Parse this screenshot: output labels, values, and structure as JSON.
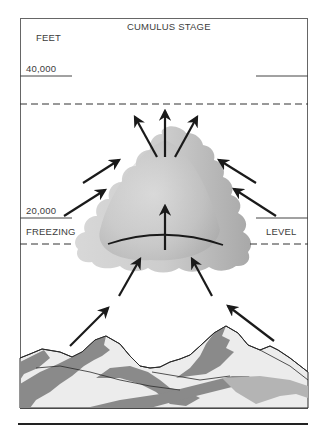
{
  "diagram": {
    "title": "CUMULUS STAGE",
    "axis_unit": "FEET",
    "altitude_marks": [
      {
        "label": "40,000",
        "value_ft": 40000
      },
      {
        "label": "20,000",
        "value_ft": 20000
      }
    ],
    "freezing_level": {
      "left_label": "FREEZING",
      "right_label": "LEVEL"
    },
    "elements": {
      "cloud": "cumulus-cloud",
      "updraft_arrows": "upward-air-flow",
      "inflow_arrows": "converging-inflow",
      "terrain": "mountain-range"
    },
    "colors": {
      "frame": "#555555",
      "arrow": "#1a1a1a",
      "cloud_light": "#dcdcdc",
      "cloud_dark": "#9a9a9a",
      "mountain_light": "#ececec",
      "mountain_dark": "#8a8a8a",
      "mountain_mid": "#b4b4b4"
    }
  }
}
